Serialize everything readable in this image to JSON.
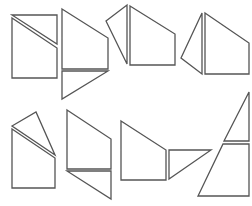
{
  "diagram": {
    "stroke_color": "#555555",
    "fill_color": "#ffffff",
    "background": "#ffffff",
    "figures": [
      {
        "id": 1,
        "pieces": [
          {
            "shape": "triangle",
            "points": "12,15 57,15 57,44"
          },
          {
            "shape": "quadrilateral",
            "points": "12,18 57,48 57,78 12,78"
          }
        ]
      },
      {
        "id": 2,
        "pieces": [
          {
            "shape": "quadrilateral",
            "points": "62,9 108,38 108,69 62,69"
          },
          {
            "shape": "triangle",
            "points": "62,71 108,71 62,99"
          }
        ]
      },
      {
        "id": 3,
        "pieces": [
          {
            "shape": "triangle",
            "points": "106,21 127,5 127,64"
          },
          {
            "shape": "quadrilateral",
            "points": "130,6 175,34 175,65 130,65"
          }
        ]
      },
      {
        "id": 4,
        "pieces": [
          {
            "shape": "triangle",
            "points": "181,58 202,13 202,74"
          },
          {
            "shape": "quadrilateral",
            "points": "205,13 249,43 249,74 205,74"
          }
        ]
      },
      {
        "id": 5,
        "pieces": [
          {
            "shape": "triangle",
            "points": "12,126 36,112 55,155"
          },
          {
            "shape": "quadrilateral",
            "points": "12,129 55,158 55,188 12,188"
          }
        ]
      },
      {
        "id": 6,
        "pieces": [
          {
            "shape": "quadrilateral",
            "points": "67,110 111,139 111,169 67,169"
          },
          {
            "shape": "triangle",
            "points": "67,171 111,171 111,199"
          }
        ]
      },
      {
        "id": 7,
        "pieces": [
          {
            "shape": "quadrilateral",
            "points": "121,121 166,150 166,180 121,180"
          },
          {
            "shape": "triangle",
            "points": "169,150 211,150 169,179"
          }
        ]
      },
      {
        "id": 8,
        "pieces": [
          {
            "shape": "triangle",
            "points": "224,141 249,92 249,141"
          },
          {
            "shape": "trapezoid",
            "points": "223,144 249,144 249,196 198,196"
          }
        ]
      }
    ]
  }
}
